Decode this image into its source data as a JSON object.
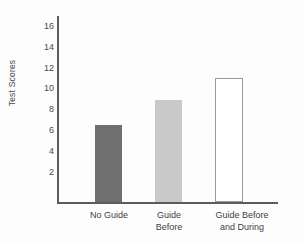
{
  "chart_data": {
    "type": "bar",
    "title": "",
    "xlabel": "",
    "ylabel": "Test Scores",
    "categories": [
      "No Guide",
      "Guide Before",
      "Guide Before and During"
    ],
    "category_lines": [
      [
        "No Guide"
      ],
      [
        "Guide",
        "Before"
      ],
      [
        "Guide Before",
        "and During"
      ]
    ],
    "values": [
      7.3,
      9.7,
      11.8
    ],
    "ylim": [
      0,
      17
    ],
    "yticks": [
      2,
      4,
      6,
      8,
      10,
      12,
      14,
      16
    ],
    "ytick_labels": [
      "2",
      "4",
      "6",
      "8",
      "10",
      "12",
      "14",
      "16"
    ],
    "grid": false,
    "legend": false,
    "bar_colors": [
      "#6f6f6f",
      "#c9c9c9",
      "#ffffff"
    ],
    "bar_edge_colors": [
      "#6f6f6f",
      "#c9c9c9",
      "#9a9a9a"
    ],
    "axis_color": "#5c5c5c",
    "background": "#fdfdfd"
  },
  "axis": {
    "y_title": "Test Scores"
  },
  "ticks": {
    "y": [
      {
        "label": "16",
        "value": 16
      },
      {
        "label": "14",
        "value": 14
      },
      {
        "label": "12",
        "value": 12
      },
      {
        "label": "10",
        "value": 10
      },
      {
        "label": "8",
        "value": 8
      },
      {
        "label": "6",
        "value": 6
      },
      {
        "label": "4",
        "value": 4
      },
      {
        "label": "2",
        "value": 2
      }
    ]
  },
  "bars": [
    {
      "label": "No Guide",
      "label_text": "No Guide",
      "value": 7.3
    },
    {
      "label": "Guide Before",
      "label_text": "Guide\nBefore",
      "value": 9.7
    },
    {
      "label": "Guide Before and During",
      "label_text": "Guide Before\nand During",
      "value": 11.8
    }
  ]
}
